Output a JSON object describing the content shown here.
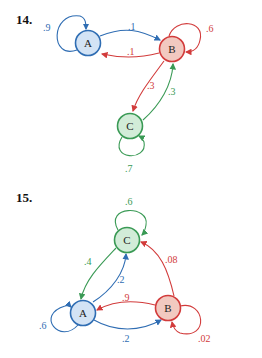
{
  "colors": {
    "A": {
      "stroke": "#2f6db3",
      "fill": "#d3e3f5"
    },
    "B": {
      "stroke": "#d23b3b",
      "fill": "#f2c9c0"
    },
    "C": {
      "stroke": "#3a9a55",
      "fill": "#d2ecd8"
    }
  },
  "problems": [
    {
      "number": "14.",
      "nodes": [
        {
          "id": "A",
          "label": "A"
        },
        {
          "id": "B",
          "label": "B"
        },
        {
          "id": "C",
          "label": "C"
        }
      ],
      "edges": [
        {
          "from": "A",
          "to": "A",
          "label": ".9"
        },
        {
          "from": "A",
          "to": "B",
          "label": ".1"
        },
        {
          "from": "B",
          "to": "A",
          "label": ".1"
        },
        {
          "from": "B",
          "to": "B",
          "label": ".6"
        },
        {
          "from": "B",
          "to": "C",
          "label": ".3"
        },
        {
          "from": "C",
          "to": "B",
          "label": ".3"
        },
        {
          "from": "C",
          "to": "C",
          "label": ".7"
        }
      ]
    },
    {
      "number": "15.",
      "nodes": [
        {
          "id": "A",
          "label": "A"
        },
        {
          "id": "B",
          "label": "B"
        },
        {
          "id": "C",
          "label": "C"
        }
      ],
      "edges": [
        {
          "from": "C",
          "to": "C",
          "label": ".6"
        },
        {
          "from": "C",
          "to": "A",
          "label": ".4"
        },
        {
          "from": "A",
          "to": "C",
          "label": ".2"
        },
        {
          "from": "B",
          "to": "C",
          "label": ".08"
        },
        {
          "from": "B",
          "to": "A",
          "label": ".9"
        },
        {
          "from": "A",
          "to": "B",
          "label": ".2"
        },
        {
          "from": "A",
          "to": "A",
          "label": ".6"
        },
        {
          "from": "B",
          "to": "B",
          "label": ".02"
        }
      ]
    }
  ]
}
